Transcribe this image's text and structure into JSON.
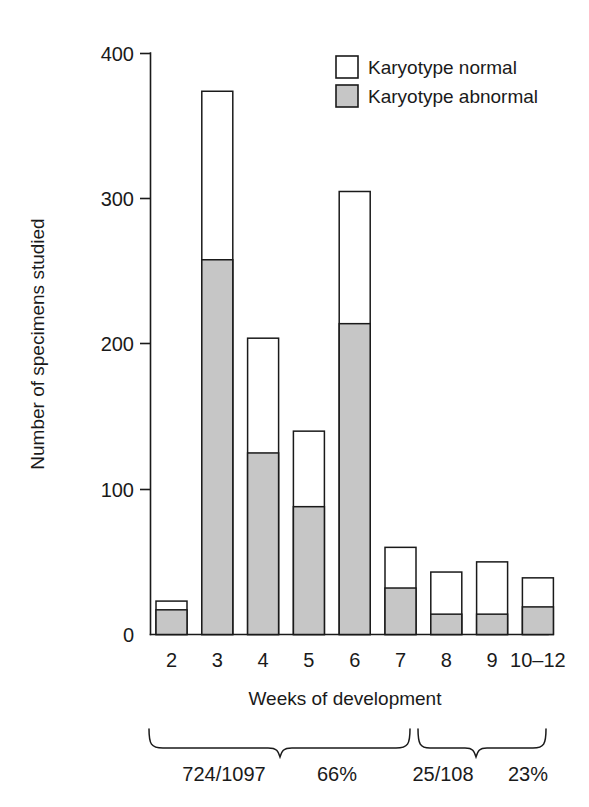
{
  "chart_data": {
    "type": "bar",
    "title": "",
    "xlabel": "Weeks of development",
    "ylabel": "Number of specimens studied",
    "categories": [
      "2",
      "3",
      "4",
      "5",
      "6",
      "7",
      "8",
      "9",
      "10–12"
    ],
    "ylim": [
      0,
      400
    ],
    "yticks": [
      0,
      100,
      200,
      300,
      400
    ],
    "ytick_labels": [
      "0",
      "100",
      "200",
      "300",
      "400"
    ],
    "grid": false,
    "stacked": true,
    "legend_position": "top-right",
    "series": [
      {
        "name": "Karyotype abnormal",
        "color": "#c6c6c6",
        "values": [
          17,
          258,
          125,
          88,
          214,
          32,
          14,
          14,
          19
        ]
      },
      {
        "name": "Karyotype normal",
        "color": "#ffffff",
        "values": [
          6,
          116,
          79,
          52,
          91,
          28,
          29,
          36,
          20
        ]
      }
    ],
    "totals": [
      23,
      374,
      204,
      140,
      305,
      60,
      43,
      50,
      39
    ],
    "annotations": [
      {
        "id": "group-early",
        "span": "2–7",
        "ratio": "724/1097",
        "percent": "66%"
      },
      {
        "id": "group-late",
        "span": "8–10–12",
        "ratio": "25/108",
        "percent": "23%"
      }
    ]
  },
  "axis": {
    "y_title": "Number of specimens studied",
    "x_title": "Weeks of development",
    "y_tick_labels": [
      "400",
      "300",
      "200",
      "100",
      "0"
    ],
    "x_tick_labels": [
      "2",
      "3",
      "4",
      "5",
      "6",
      "7",
      "8",
      "9",
      "10–12"
    ]
  },
  "legend": {
    "items": [
      {
        "label": "Karyotype normal",
        "swatch": "white"
      },
      {
        "label": "Karyotype abnormal",
        "swatch": "gray"
      }
    ]
  },
  "annotations": {
    "ratio_early": "724/1097",
    "percent_early": "66%",
    "ratio_late": "25/108",
    "percent_late": "23%"
  },
  "colors": {
    "abnormal_fill": "#c6c6c6",
    "normal_fill": "#ffffff",
    "ink": "#1a1a1a",
    "background": "#ffffff"
  }
}
